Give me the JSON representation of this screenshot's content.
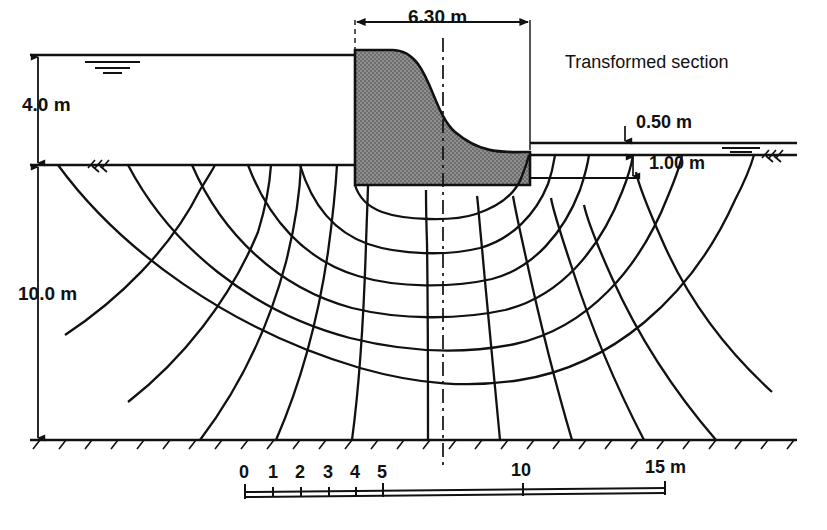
{
  "figure": {
    "title_note": "Transformed section",
    "type": "seepage-flow-net-under-concrete-dam"
  },
  "dimensions": {
    "upstream_head": "4.0 m",
    "foundation_depth": "10.0 m",
    "dam_base_width": "6.30 m",
    "downstream_water_depth": "0.50 m",
    "dam_embedment": "1.00 m"
  },
  "scale_bar": {
    "unit_label": "15 m",
    "ticks": [
      {
        "label": "0",
        "value": 0
      },
      {
        "label": "1",
        "value": 1
      },
      {
        "label": "2",
        "value": 2
      },
      {
        "label": "3",
        "value": 3
      },
      {
        "label": "4",
        "value": 4
      },
      {
        "label": "5",
        "value": 5
      },
      {
        "label": "10",
        "value": 10
      },
      {
        "label": "15",
        "value": 15
      }
    ]
  },
  "colors": {
    "dam_fill": "#8a8a8a",
    "line": "#111111",
    "background": "#ffffff"
  }
}
